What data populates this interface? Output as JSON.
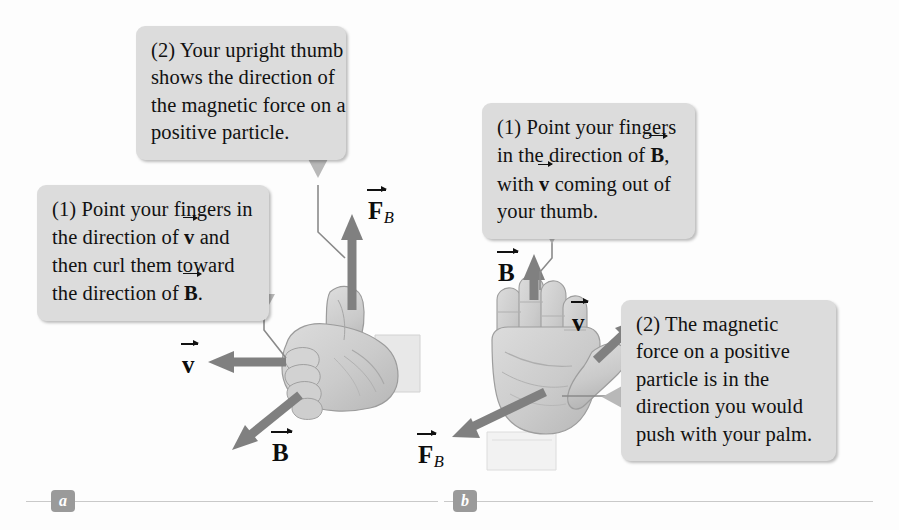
{
  "figure": {
    "background_color": "#fdfdfd",
    "callout_color": "#dcdcdc",
    "arrow_color": "#808080",
    "hand_color": "#cfcfcf",
    "panel_label_color": "#9a9a9a"
  },
  "panels": [
    {
      "id": "a",
      "label": "a"
    },
    {
      "id": "b",
      "label": "b"
    }
  ],
  "callouts": {
    "a_step2": {
      "lines": [
        {
          "before": "(2) Your upright thumb",
          "vec": "",
          "after": ""
        },
        {
          "before": "shows the direction of",
          "vec": "",
          "after": ""
        },
        {
          "before": "the magnetic force on a",
          "vec": "",
          "after": ""
        },
        {
          "before": "positive particle.",
          "vec": "",
          "after": ""
        }
      ]
    },
    "a_step1": {
      "lines": [
        {
          "before": "(1) Point your fingers in",
          "vec": "",
          "after": ""
        },
        {
          "before": "the direction of ",
          "vec": "v",
          "after": " and"
        },
        {
          "before": "then curl them toward",
          "vec": "",
          "after": ""
        },
        {
          "before": "the direction of ",
          "vec": "B",
          "after": "."
        }
      ]
    },
    "b_step1": {
      "lines": [
        {
          "before": "(1) Point your fingers",
          "vec": "",
          "after": ""
        },
        {
          "before": "in the direction of ",
          "vec": "B",
          "after": ","
        },
        {
          "before": "with ",
          "vec": "v",
          "after": " coming out of"
        },
        {
          "before": "your thumb.",
          "vec": "",
          "after": ""
        }
      ]
    },
    "b_step2": {
      "lines": [
        {
          "before": "(2) The magnetic",
          "vec": "",
          "after": ""
        },
        {
          "before": "force on a positive",
          "vec": "",
          "after": ""
        },
        {
          "before": "particle is in the",
          "vec": "",
          "after": ""
        },
        {
          "before": "direction you would",
          "vec": "",
          "after": ""
        },
        {
          "before": "push with your palm.",
          "vec": "",
          "after": ""
        }
      ]
    }
  },
  "vector_labels": {
    "a_force": {
      "symbol": "F",
      "subscript": "B",
      "direction": "up"
    },
    "a_velocity": {
      "symbol": "v",
      "subscript": "",
      "direction": "left"
    },
    "a_field": {
      "symbol": "B",
      "subscript": "",
      "direction": "down-left"
    },
    "b_field": {
      "symbol": "B",
      "subscript": "",
      "direction": "up"
    },
    "b_velocity": {
      "symbol": "v",
      "subscript": "",
      "direction": "up-right"
    },
    "b_force": {
      "symbol": "F",
      "subscript": "B",
      "direction": "down-left"
    }
  }
}
